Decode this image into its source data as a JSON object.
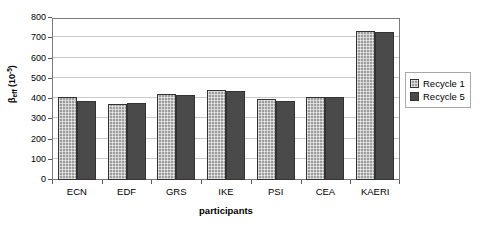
{
  "chart_data": {
    "type": "bar",
    "title": "",
    "subtitle": "",
    "xlabel": "participants",
    "ylabel": "βeff (10-5)",
    "ylabel_parts": {
      "symbol": "β",
      "subscript": "eff",
      "unit_prefix": " (10",
      "unit_exponent": "-5",
      "unit_suffix": ")"
    },
    "categories": [
      "ECN",
      "EDF",
      "GRS",
      "IKE",
      "PSI",
      "CEA",
      "KAERI"
    ],
    "series": [
      {
        "name": "Recycle 1",
        "color": "#9d9d9d",
        "pattern": "cross-hatch",
        "values": [
          408,
          375,
          427,
          443,
          399,
          411,
          737
        ]
      },
      {
        "name": "Recycle 5",
        "color": "#4a4a4a",
        "pattern": "solid",
        "values": [
          392,
          378,
          422,
          440,
          388,
          410,
          730
        ]
      }
    ],
    "ylim": [
      0,
      800
    ],
    "ytick_step": 100,
    "yticks": [
      0,
      100,
      200,
      300,
      400,
      500,
      600,
      700,
      800
    ],
    "ytick_labels": [
      "0",
      "100",
      "200",
      "300",
      "400",
      "500",
      "600",
      "700",
      "800"
    ],
    "grid": {
      "horizontal": true,
      "vertical": false,
      "color": "#c8c8c8"
    },
    "legend": {
      "position": "right",
      "bordered": true,
      "entries": [
        "Recycle 1",
        "Recycle 5"
      ]
    },
    "plot_border_color": "#7a7a7a",
    "background": "#ffffff"
  }
}
